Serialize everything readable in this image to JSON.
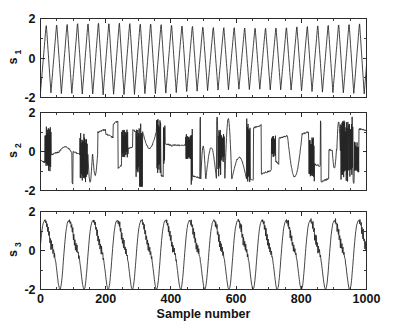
{
  "figure": {
    "name": "source-signals-figure",
    "background": "#ffffff",
    "line_color": "#232323",
    "axis_color": "#2b2b2b",
    "width": 395,
    "height": 324
  },
  "chart_data": {
    "type": "line",
    "title": "",
    "subtitle": "",
    "xlabel": "Sample number",
    "ylabel": "",
    "grid": false,
    "legend": null,
    "layout": "three stacked subplots sharing the x axis",
    "xlim": [
      0,
      1000
    ],
    "xticks": [
      0,
      200,
      400,
      600,
      800,
      1000
    ],
    "xticklabels": [
      "0",
      "200",
      "400",
      "600",
      "800",
      "1000"
    ],
    "x_minor_ticks_per_interval": 3,
    "subplots": [
      {
        "id": "s1",
        "ylabel": "s",
        "ylabel_subscript": "1",
        "ylim": [
          -2,
          2
        ],
        "yticks": [
          -2,
          0,
          2
        ],
        "yticklabels": [
          "-2",
          "0",
          "2"
        ],
        "signal_type": "sawtooth-triangular periodic wave",
        "period_samples": 32,
        "amplitude": 1.85,
        "n_points": 1000,
        "description": "Periodic asymmetric triangle / sawtooth waveform oscillating between about -1.9 and 1.9 with roughly 31 cycles across 1000 samples."
      },
      {
        "id": "s2",
        "ylabel": "s",
        "ylabel_subscript": "2",
        "ylim": [
          -2,
          2
        ],
        "yticks": [
          -2,
          0,
          2
        ],
        "yticklabels": [
          "-2",
          "0",
          "2"
        ],
        "signal_type": "speech-like burst signal with plateaus and abrupt transitions",
        "amplitude": 1.8,
        "n_points": 1000,
        "description": "Irregular non-stationary signal with flat plateau segments, sharp vertical jumps and dense high frequency bursts, ranging roughly from -1.8 to 1.8."
      },
      {
        "id": "s3",
        "ylabel": "s",
        "ylabel_subscript": "3",
        "ylim": [
          -2,
          2
        ],
        "yticks": [
          -2,
          0,
          2
        ],
        "yticklabels": [
          "-2",
          "0",
          "2"
        ],
        "signal_type": "smooth low frequency wave with superimposed high frequency ripple",
        "period_samples": 74,
        "amplitude": 1.75,
        "n_points": 1000,
        "description": "Slow quasi-sinusoidal oscillation with about 13.5 cycles across 1000 samples, carrying small high frequency ripple on the falling slopes and troughs."
      }
    ]
  }
}
